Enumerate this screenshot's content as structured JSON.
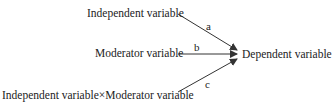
{
  "diagram": {
    "nodes": {
      "independent": "Independent variable",
      "moderator": "Moderator variable",
      "interaction": "Independent variable×Moderator variable",
      "dependent": "Dependent variable"
    },
    "paths": [
      {
        "from": "independent",
        "to": "dependent",
        "label": "a"
      },
      {
        "from": "moderator",
        "to": "dependent",
        "label": "b"
      },
      {
        "from": "interaction",
        "to": "dependent",
        "label": "c"
      }
    ],
    "colors": {
      "line": "#333333",
      "text": "#222222"
    }
  }
}
